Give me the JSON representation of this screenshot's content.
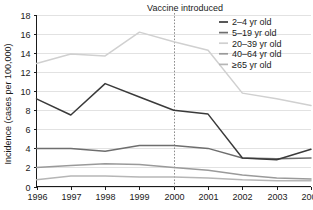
{
  "chart_data": {
    "type": "line",
    "title": "Vaccine introduced",
    "xlabel": "",
    "ylabel": "Incidence (cases per 100,000)",
    "x": [
      1996,
      1997,
      1998,
      1999,
      2000,
      2001,
      2002,
      2003,
      2004
    ],
    "xtick_labels": [
      "1996",
      "1997",
      "1998",
      "1999",
      "2000",
      "2001",
      "2002",
      "2003",
      "2004"
    ],
    "ytick_labels": [
      "0",
      "2",
      "4",
      "6",
      "8",
      "10",
      "12",
      "14",
      "16",
      "18"
    ],
    "ytick_values": [
      0,
      2,
      4,
      6,
      8,
      10,
      12,
      14,
      16,
      18
    ],
    "ylim": [
      0,
      18
    ],
    "xlim": [
      1996,
      2004
    ],
    "grid": true,
    "legend_position": "top-right",
    "annotations": [
      {
        "label": "Vaccine introduced",
        "x": 2000,
        "style": "vertical-dashed-line"
      }
    ],
    "series": [
      {
        "name": "2–4 yr old",
        "color": "#3a3a3a",
        "values": [
          9.2,
          7.5,
          10.8,
          9.4,
          8.0,
          7.6,
          3.0,
          2.8,
          3.9
        ]
      },
      {
        "name": "5–19 yr old",
        "color": "#6e6e6e",
        "values": [
          4.0,
          4.0,
          3.7,
          4.3,
          4.3,
          4.0,
          3.0,
          2.9,
          3.0
        ]
      },
      {
        "name": "20–39 yr old",
        "color": "#d0d0d0",
        "values": [
          12.9,
          13.9,
          13.7,
          16.2,
          15.2,
          14.3,
          9.8,
          9.2,
          8.5
        ]
      },
      {
        "name": "40–64 yr old",
        "color": "#9a9a9a",
        "values": [
          2.0,
          2.2,
          2.4,
          2.3,
          2.0,
          1.7,
          1.2,
          0.9,
          0.8
        ]
      },
      {
        "name": "≥65 yr old",
        "color": "#b6b6b6",
        "values": [
          0.7,
          1.1,
          1.1,
          1.0,
          1.0,
          0.9,
          0.7,
          0.6,
          0.6
        ]
      }
    ]
  }
}
